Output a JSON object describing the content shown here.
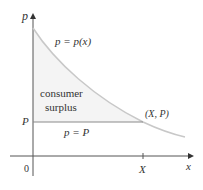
{
  "diagram": {
    "type": "consumer-surplus-graph",
    "axes": {
      "y_label": "p",
      "x_label": "x",
      "origin_label": "0"
    },
    "labels": {
      "curve": "p = p(x)",
      "region_line1": "consumer",
      "region_line2": "surplus",
      "point": "(X, P)",
      "price_line": "p = P",
      "y_tick": "P",
      "x_tick": "X"
    },
    "colors": {
      "axis": "#555555",
      "curve": "#c8c8c8",
      "price_line": "#8a8a8a",
      "shade": "#f4f4f4",
      "text": "#333333"
    }
  }
}
